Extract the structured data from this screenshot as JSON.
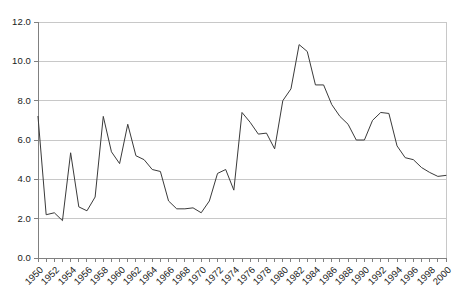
{
  "chart_data": {
    "type": "line",
    "title": "",
    "subtitle": "",
    "xlabel": "",
    "ylabel": "",
    "xlim": [
      1950,
      2000
    ],
    "ylim": [
      0.0,
      12.0
    ],
    "ytick_labels": [
      "12.0",
      "10.0",
      "8.0",
      "6.0",
      "4.0",
      "2.0",
      "0.0"
    ],
    "ytick_values": [
      12.0,
      10.0,
      8.0,
      6.0,
      4.0,
      2.0,
      0.0
    ],
    "xtick_labels": [
      "1950",
      "1952",
      "1954",
      "1956",
      "1958",
      "1960",
      "1962",
      "1964",
      "1966",
      "1968",
      "1970",
      "1972",
      "1974",
      "1976",
      "1978",
      "1980",
      "1982",
      "1984",
      "1986",
      "1988",
      "1990",
      "1992",
      "1994",
      "1996",
      "1998",
      "2000"
    ],
    "xtick_label_step": 2,
    "minor_tick_step": 1,
    "grid": "horizontal",
    "legend": "none",
    "line_color": "#3a3a3a",
    "grid_color": "#c8c8c8",
    "axis_color": "#808080",
    "background": "#ffffff",
    "x": [
      1950,
      1951,
      1952,
      1953,
      1954,
      1955,
      1956,
      1957,
      1958,
      1959,
      1960,
      1961,
      1962,
      1963,
      1964,
      1965,
      1966,
      1967,
      1968,
      1969,
      1970,
      1971,
      1972,
      1973,
      1974,
      1975,
      1976,
      1977,
      1978,
      1979,
      1980,
      1981,
      1982,
      1983,
      1984,
      1985,
      1986,
      1987,
      1988,
      1989,
      1990,
      1991,
      1992,
      1993,
      1994,
      1995,
      1996,
      1997,
      1998,
      1999,
      2000
    ],
    "values": [
      7.2,
      2.2,
      2.3,
      1.9,
      5.35,
      2.6,
      2.4,
      3.1,
      7.2,
      5.4,
      4.8,
      6.8,
      5.2,
      5.0,
      4.5,
      4.4,
      2.9,
      2.5,
      2.5,
      2.55,
      2.3,
      2.9,
      4.3,
      4.5,
      3.45,
      7.4,
      6.9,
      6.3,
      6.35,
      5.55,
      8.0,
      8.6,
      10.85,
      10.5,
      8.8,
      8.8,
      7.8,
      7.2,
      6.8,
      6.0,
      6.0,
      7.0,
      7.4,
      7.35,
      5.7,
      5.1,
      5.0,
      4.6,
      4.35,
      4.15,
      4.2
    ]
  },
  "plot_geometry": {
    "left": 38,
    "top": 22,
    "right": 446,
    "bottom": 258
  }
}
